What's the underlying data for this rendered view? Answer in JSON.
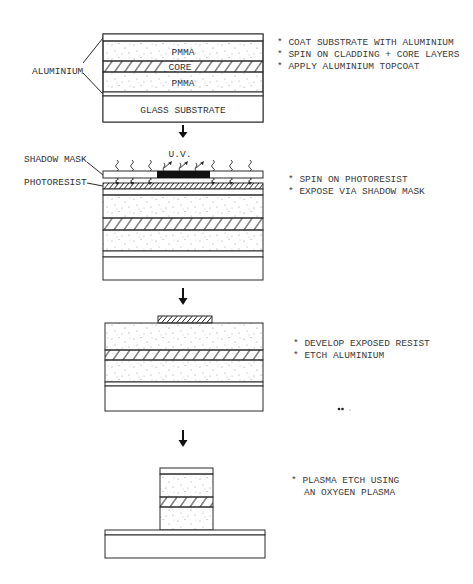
{
  "diagram": {
    "title": "",
    "stages": [
      {
        "id": "stage-1",
        "layers": [
          "ALUMINIUM topcoat",
          "PMMA",
          "CORE",
          "PMMA",
          "ALUMINIUM",
          "GLASS SUBSTRATE"
        ],
        "labels": {
          "aluminium": "ALUMINIUM",
          "pmma_top": "PMMA",
          "core": "CORE",
          "pmma_bottom": "PMMA",
          "glass": "GLASS SUBSTRATE"
        },
        "notes": [
          "* COAT SUBSTRATE WITH ALUMINIUM",
          "* SPIN ON CLADDING + CORE LAYERS",
          "* APPLY ALUMINIUM TOPCOAT"
        ]
      },
      {
        "id": "stage-2",
        "labels": {
          "shadow_mask": "SHADOW MASK",
          "photoresist": "PHOTORESIST",
          "uv": "U.V."
        },
        "notes": [
          "* SPIN ON PHOTORESIST",
          "* EXPOSE VIA SHADOW MASK"
        ]
      },
      {
        "id": "stage-3",
        "notes": [
          "* DEVELOP EXPOSED RESIST",
          "* ETCH ALUMINIUM"
        ],
        "stray_mark": "•• ."
      },
      {
        "id": "stage-4",
        "notes": [
          "* PLASMA ETCH USING",
          "AN OXYGEN PLASMA"
        ]
      }
    ],
    "arrows": [
      "down-arrow",
      "down-arrow",
      "down-arrow"
    ],
    "colors": {
      "line": "#2a2a2a",
      "mask_opaque": "#111111",
      "stipple": "#8a8a8a",
      "background": "#ffffff"
    }
  }
}
